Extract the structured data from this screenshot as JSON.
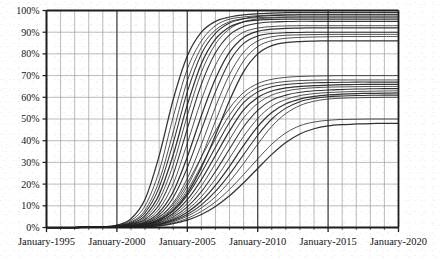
{
  "chart_data": {
    "type": "line",
    "title": "",
    "subtitle": "",
    "xlabel": "",
    "ylabel": "",
    "xlim": [
      "January-1995",
      "January-2020"
    ],
    "ylim": [
      0,
      100
    ],
    "y_unit": "%",
    "grid": true,
    "grid_minor_x_years": 1,
    "grid_major_x_years": 5,
    "grid_y_step": 10,
    "legend": "none",
    "annotations": [],
    "y_ticks": [
      "0%",
      "10%",
      "20%",
      "30%",
      "40%",
      "50%",
      "60%",
      "70%",
      "80%",
      "90%",
      "100%"
    ],
    "y_tick_values": [
      0,
      10,
      20,
      30,
      40,
      50,
      60,
      70,
      80,
      90,
      100
    ],
    "x_ticks": [
      "January-1995",
      "January-2000",
      "January-2005",
      "January-2010",
      "January-2015",
      "January-2020"
    ],
    "x_tick_values": [
      1995,
      2000,
      2005,
      2010,
      2015,
      2020
    ],
    "x_minor_ticks": [
      1995,
      1996,
      1997,
      1998,
      1999,
      2000,
      2001,
      2002,
      2003,
      2004,
      2005,
      2006,
      2007,
      2008,
      2009,
      2010,
      2011,
      2012,
      2013,
      2014,
      2015,
      2016,
      2017,
      2018,
      2019,
      2020
    ],
    "x": [
      1995,
      1996,
      1997,
      1998,
      1999,
      2000,
      2001,
      2002,
      2003,
      2004,
      2005,
      2006,
      2007,
      2008,
      2009,
      2010,
      2011,
      2012,
      2013,
      2014,
      2015,
      2016,
      2017,
      2018,
      2019,
      2020
    ],
    "series": [
      {
        "name": "curve-01",
        "saturation": 99,
        "midpoint": 2003.2,
        "rate": 1.05,
        "values": [
          0,
          0,
          0,
          0.1,
          0.3,
          1.1,
          4.0,
          13.0,
          33.0,
          59.0,
          79.0,
          90.0,
          95.0,
          97.0,
          98.0,
          98.5,
          98.8,
          99.0,
          99.0,
          99.0,
          99.0,
          99.0,
          99.0,
          99.0,
          99.0,
          99.0
        ]
      },
      {
        "name": "curve-02",
        "saturation": 98,
        "midpoint": 2003.6,
        "rate": 1.0,
        "values": [
          0,
          0,
          0,
          0.1,
          0.3,
          1.0,
          3.2,
          10.0,
          26.0,
          51.0,
          73.0,
          86.0,
          93.0,
          96.0,
          97.0,
          97.6,
          97.9,
          98.0,
          98.0,
          98.0,
          98.0,
          98.0,
          98.0,
          98.0,
          98.0,
          98.0
        ]
      },
      {
        "name": "curve-03",
        "saturation": 97,
        "midpoint": 2004.0,
        "rate": 0.98,
        "values": [
          0,
          0,
          0,
          0.1,
          0.2,
          0.8,
          2.6,
          8.0,
          21.5,
          44.0,
          67.5,
          83.0,
          91.0,
          94.8,
          96.2,
          96.7,
          96.9,
          97.0,
          97.0,
          97.0,
          97.0,
          97.0,
          97.0,
          97.0,
          97.0,
          97.0
        ]
      },
      {
        "name": "curve-04",
        "saturation": 98,
        "midpoint": 2004.4,
        "rate": 0.92,
        "values": [
          0,
          0,
          0,
          0.1,
          0.2,
          0.7,
          2.2,
          6.8,
          18.5,
          39.0,
          62.5,
          80.0,
          89.5,
          94.2,
          96.2,
          97.2,
          97.7,
          97.9,
          98.0,
          98.0,
          98.0,
          98.0,
          98.0,
          98.0,
          98.0,
          98.0
        ]
      },
      {
        "name": "curve-05",
        "saturation": 96,
        "midpoint": 2004.8,
        "rate": 0.9,
        "values": [
          0,
          0,
          0,
          0.1,
          0.2,
          0.6,
          1.8,
          5.5,
          15.2,
          33.5,
          56.5,
          75.5,
          86.8,
          92.4,
          94.8,
          95.6,
          95.9,
          96.0,
          96.0,
          96.0,
          96.0,
          96.0,
          96.0,
          96.0,
          96.0,
          96.0
        ]
      },
      {
        "name": "curve-06",
        "saturation": 97,
        "midpoint": 2005.3,
        "rate": 0.85,
        "values": [
          0,
          0,
          0,
          0.1,
          0.2,
          0.5,
          1.5,
          4.6,
          12.8,
          29.0,
          51.5,
          71.5,
          84.5,
          91.5,
          94.8,
          96.1,
          96.6,
          96.9,
          97.0,
          97.0,
          97.0,
          97.0,
          97.0,
          97.0,
          97.0,
          97.0
        ]
      },
      {
        "name": "curve-07",
        "saturation": 95,
        "midpoint": 2005.8,
        "rate": 0.82,
        "values": [
          0,
          0,
          0,
          0.1,
          0.15,
          0.45,
          1.3,
          3.8,
          10.5,
          24.5,
          45.5,
          66.0,
          80.5,
          88.8,
          92.6,
          94.1,
          94.7,
          94.9,
          95.0,
          95.0,
          95.0,
          95.0,
          95.0,
          95.0,
          95.0,
          95.0
        ]
      },
      {
        "name": "curve-08",
        "saturation": 93,
        "midpoint": 2006.3,
        "rate": 0.78,
        "values": [
          0,
          0,
          0,
          0.1,
          0.15,
          0.4,
          1.1,
          3.2,
          8.6,
          20.2,
          38.8,
          58.8,
          74.8,
          85.0,
          90.0,
          91.9,
          92.6,
          92.9,
          93.0,
          93.0,
          93.0,
          93.0,
          93.0,
          93.0,
          93.0,
          93.0
        ]
      },
      {
        "name": "curve-09",
        "saturation": 92,
        "midpoint": 2006.9,
        "rate": 0.72,
        "values": [
          0,
          0,
          0,
          0.05,
          0.12,
          0.35,
          0.95,
          2.6,
          7.0,
          16.5,
          32.5,
          51.5,
          68.5,
          80.8,
          87.6,
          90.4,
          91.4,
          91.8,
          91.9,
          92.0,
          92.0,
          92.0,
          92.0,
          92.0,
          92.0,
          92.0
        ]
      },
      {
        "name": "curve-10",
        "saturation": 90,
        "midpoint": 2007.4,
        "rate": 0.7,
        "values": [
          0,
          0,
          0,
          0.05,
          0.1,
          0.3,
          0.8,
          2.2,
          5.8,
          13.8,
          27.5,
          45.0,
          62.5,
          76.5,
          84.8,
          88.3,
          89.4,
          89.8,
          89.9,
          90.0,
          90.0,
          90.0,
          90.0,
          90.0,
          90.0,
          90.0
        ]
      },
      {
        "name": "curve-11",
        "saturation": 89,
        "midpoint": 2008.0,
        "rate": 0.64,
        "values": [
          0,
          0,
          0,
          0.05,
          0.1,
          0.26,
          0.7,
          1.9,
          4.9,
          11.4,
          22.6,
          38.2,
          55.5,
          70.5,
          80.8,
          86.0,
          87.9,
          88.6,
          88.8,
          88.9,
          89.0,
          89.0,
          89.0,
          89.0,
          89.0,
          89.0
        ]
      },
      {
        "name": "curve-12",
        "saturation": 88,
        "midpoint": 2008.6,
        "rate": 0.6,
        "values": [
          0,
          0,
          0,
          0.04,
          0.09,
          0.22,
          0.6,
          1.6,
          4.1,
          9.6,
          19.0,
          32.5,
          49.0,
          64.8,
          76.8,
          83.4,
          86.1,
          87.2,
          87.6,
          87.8,
          87.9,
          88.0,
          88.0,
          88.0,
          88.0,
          88.0
        ]
      },
      {
        "name": "curve-13",
        "saturation": 86,
        "midpoint": 2009.2,
        "rate": 0.56,
        "values": [
          0,
          0,
          0,
          0.04,
          0.08,
          0.2,
          0.5,
          1.3,
          3.4,
          8.0,
          15.8,
          27.6,
          42.5,
          58.5,
          71.8,
          80.0,
          83.8,
          85.2,
          85.7,
          85.9,
          86.0,
          86.0,
          86.0,
          86.0,
          86.0,
          86.0
        ]
      },
      {
        "name": "curve-14",
        "saturation": 70,
        "midpoint": 2007.0,
        "rate": 0.52,
        "values": [
          0,
          0,
          0,
          0.05,
          0.12,
          0.3,
          0.8,
          2.0,
          4.8,
          10.6,
          20.5,
          32.5,
          44.5,
          55.0,
          62.2,
          66.3,
          68.3,
          69.2,
          69.6,
          69.8,
          69.9,
          70.0,
          70.0,
          70.0,
          70.0,
          70.0
        ]
      },
      {
        "name": "curve-15",
        "saturation": 68,
        "midpoint": 2007.8,
        "rate": 0.5,
        "values": [
          0,
          0,
          0,
          0.04,
          0.1,
          0.25,
          0.65,
          1.6,
          3.9,
          8.8,
          17.2,
          28.5,
          40.8,
          51.8,
          60.0,
          64.5,
          66.4,
          67.3,
          67.7,
          67.9,
          68.0,
          68.0,
          68.0,
          68.0,
          68.0,
          68.0
        ]
      },
      {
        "name": "curve-16",
        "saturation": 67,
        "midpoint": 2008.3,
        "rate": 0.48,
        "values": [
          0,
          0,
          0,
          0.04,
          0.09,
          0.22,
          0.55,
          1.4,
          3.3,
          7.5,
          14.8,
          25.2,
          37.0,
          48.5,
          57.5,
          62.5,
          64.9,
          65.9,
          66.4,
          66.7,
          66.8,
          66.9,
          67.0,
          67.0,
          67.0,
          67.0
        ]
      },
      {
        "name": "curve-17",
        "saturation": 66,
        "midpoint": 2008.8,
        "rate": 0.46,
        "values": [
          0,
          0,
          0,
          0.03,
          0.08,
          0.2,
          0.48,
          1.2,
          2.9,
          6.5,
          12.8,
          22.0,
          33.2,
          44.5,
          54.2,
          59.9,
          62.9,
          64.3,
          65.0,
          65.4,
          65.6,
          65.8,
          65.9,
          66.0,
          66.0,
          66.0
        ]
      },
      {
        "name": "curve-18",
        "saturation": 65,
        "midpoint": 2009.3,
        "rate": 0.44,
        "values": [
          0,
          0,
          0,
          0.03,
          0.07,
          0.17,
          0.42,
          1.05,
          2.5,
          5.7,
          11.1,
          19.2,
          29.5,
          40.5,
          50.5,
          57.2,
          61.0,
          62.9,
          63.9,
          64.4,
          64.7,
          64.8,
          64.9,
          65.0,
          65.0,
          65.0
        ]
      },
      {
        "name": "curve-19",
        "saturation": 64,
        "midpoint": 2009.9,
        "rate": 0.42,
        "values": [
          0,
          0,
          0,
          0.03,
          0.06,
          0.15,
          0.37,
          0.9,
          2.2,
          4.9,
          9.5,
          16.5,
          25.8,
          36.2,
          46.4,
          54.0,
          58.7,
          61.0,
          62.3,
          63.0,
          63.4,
          63.6,
          63.8,
          63.9,
          64.0,
          64.0
        ]
      },
      {
        "name": "curve-20",
        "saturation": 63,
        "midpoint": 2010.4,
        "rate": 0.4,
        "values": [
          0,
          0,
          0,
          0.02,
          0.05,
          0.13,
          0.32,
          0.78,
          1.9,
          4.2,
          8.2,
          14.2,
          22.4,
          32.0,
          42.0,
          50.2,
          55.9,
          59.0,
          60.8,
          61.7,
          62.2,
          62.5,
          62.7,
          62.8,
          62.9,
          63.0
        ]
      },
      {
        "name": "curve-21",
        "saturation": 62,
        "midpoint": 2011.0,
        "rate": 0.38,
        "values": [
          0,
          0,
          0,
          0.02,
          0.05,
          0.11,
          0.28,
          0.68,
          1.6,
          3.6,
          7.0,
          12.2,
          19.4,
          28.2,
          37.8,
          46.5,
          53.0,
          57.0,
          59.2,
          60.4,
          61.1,
          61.5,
          61.7,
          61.8,
          61.9,
          62.0
        ]
      },
      {
        "name": "curve-22",
        "saturation": 61,
        "midpoint": 2011.6,
        "rate": 0.36,
        "values": [
          0,
          0,
          0,
          0.02,
          0.04,
          0.1,
          0.24,
          0.58,
          1.4,
          3.1,
          6.0,
          10.4,
          16.6,
          24.5,
          33.6,
          42.5,
          50.0,
          55.0,
          58.0,
          59.5,
          60.3,
          60.6,
          60.8,
          60.9,
          61.0,
          61.0
        ]
      },
      {
        "name": "curve-23",
        "saturation": 60,
        "midpoint": 2012.2,
        "rate": 0.34,
        "values": [
          0,
          0,
          0,
          0.02,
          0.04,
          0.09,
          0.21,
          0.5,
          1.2,
          2.7,
          5.2,
          9.0,
          14.2,
          21.2,
          29.5,
          38.4,
          46.6,
          52.5,
          56.2,
          58.2,
          59.2,
          59.6,
          59.8,
          59.9,
          60.0,
          60.0
        ]
      },
      {
        "name": "curve-24",
        "saturation": 50,
        "midpoint": 2012.5,
        "rate": 0.3,
        "values": [
          0,
          0,
          0,
          0.01,
          0.03,
          0.07,
          0.17,
          0.4,
          0.95,
          2.1,
          4.2,
          7.4,
          11.8,
          17.6,
          24.4,
          31.6,
          38.4,
          43.6,
          46.9,
          48.6,
          49.4,
          49.8,
          49.9,
          50.0,
          50.0,
          50.0
        ]
      },
      {
        "name": "curve-25",
        "saturation": 48,
        "midpoint": 2013.2,
        "rate": 0.28,
        "values": [
          0,
          0,
          0,
          0.01,
          0.02,
          0.06,
          0.14,
          0.33,
          0.78,
          1.75,
          3.4,
          6.0,
          9.7,
          14.6,
          20.6,
          27.2,
          33.7,
          39.2,
          43.1,
          45.5,
          46.8,
          47.4,
          47.7,
          47.9,
          48.0,
          48.0
        ]
      }
    ]
  },
  "axis_style": {
    "grid_color": "#8d8d8d",
    "axis_color": "#1d1d1d",
    "major_grid_color": "#4a4a4a",
    "line_color": "#222222",
    "background": "#ffffff"
  }
}
